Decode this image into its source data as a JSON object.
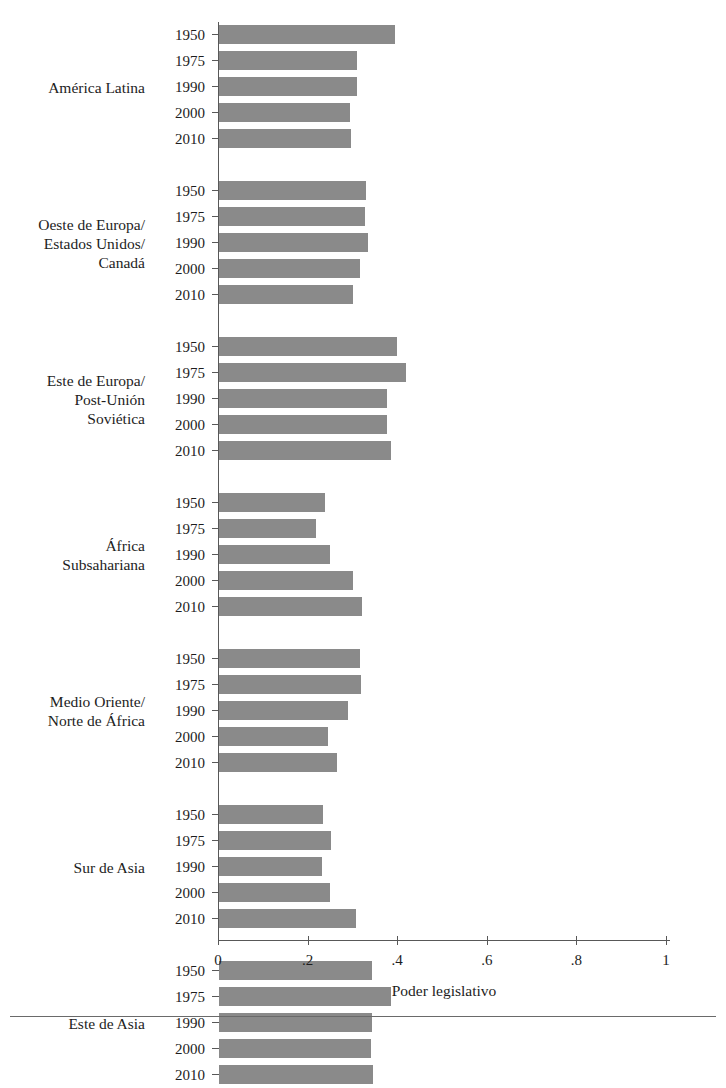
{
  "chart_data": {
    "type": "bar",
    "orientation": "horizontal",
    "title": "",
    "xlabel": "Poder legislativo",
    "ylabel": "",
    "xlim": [
      0,
      1.08
    ],
    "xticks": [
      0,
      0.2,
      0.4,
      0.6,
      0.8,
      1
    ],
    "xticklabels": [
      "0",
      ".2",
      ".4",
      ".6",
      ".8",
      "1"
    ],
    "grid": false,
    "legend": null,
    "bar_color": "#8a8a8a",
    "categories": [
      "1950",
      "1975",
      "1990",
      "2000",
      "2010"
    ],
    "groups": [
      {
        "label": "América Latina",
        "values": [
          0.393,
          0.307,
          0.309,
          0.293,
          0.294
        ]
      },
      {
        "label": "Oeste de Europa/\nEstados Unidos/\nCanadá",
        "values": [
          0.328,
          0.326,
          0.333,
          0.315,
          0.3
        ]
      },
      {
        "label": "Este de Europa/\nPost-Unión\nSoviética",
        "values": [
          0.398,
          0.417,
          0.374,
          0.374,
          0.385
        ]
      },
      {
        "label": "África\nSubsahariana",
        "values": [
          0.237,
          0.216,
          0.248,
          0.3,
          0.32
        ]
      },
      {
        "label": "Medio Oriente/\nNorte de África",
        "values": [
          0.314,
          0.317,
          0.287,
          0.244,
          0.263
        ]
      },
      {
        "label": "Sur de Asia",
        "values": [
          0.233,
          0.25,
          0.229,
          0.247,
          0.306
        ]
      },
      {
        "label": "Este de Asia",
        "values": [
          0.341,
          0.385,
          0.341,
          0.339,
          0.344
        ]
      }
    ]
  }
}
